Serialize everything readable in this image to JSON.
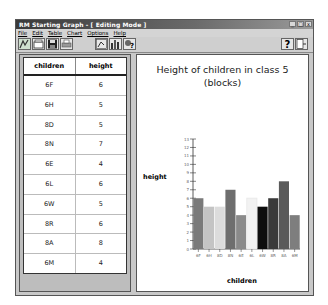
{
  "window": {
    "title": "RM Starting Graph - [ Editing Mode ]",
    "controls": [
      "_",
      "□",
      "x"
    ]
  },
  "menu": [
    "File",
    "Edit",
    "Table",
    "Chart",
    "Options",
    "Help"
  ],
  "toolbar": {
    "left_icons": [
      "new-graph-icon",
      "open-icon",
      "save-icon",
      "print-icon"
    ],
    "mid_icons": [
      "chart-type-icon",
      "bar-chart-icon",
      "wizard-help-icon"
    ],
    "right_icons": [
      "help-question-icon",
      "exit-door-icon"
    ],
    "help_glyph": "?"
  },
  "table": {
    "headers": [
      "children",
      "height"
    ],
    "rows": [
      [
        "6F",
        "6"
      ],
      [
        "6H",
        "5"
      ],
      [
        "8D",
        "5"
      ],
      [
        "8N",
        "7"
      ],
      [
        "6E",
        "4"
      ],
      [
        "6L",
        "6"
      ],
      [
        "6W",
        "5"
      ],
      [
        "8R",
        "6"
      ],
      [
        "8A",
        "8"
      ],
      [
        "6M",
        "4"
      ]
    ]
  },
  "chart_data": {
    "type": "bar",
    "title": "Height of children in class 5 (blocks)",
    "xlabel": "children",
    "ylabel": "height",
    "categories": [
      "6F",
      "6H",
      "8D",
      "8N",
      "6E",
      "6L",
      "6W",
      "8R",
      "8A",
      "6M"
    ],
    "values": [
      6,
      5,
      5,
      7,
      4,
      6,
      5,
      6,
      8,
      4
    ],
    "colors": [
      "#7a7a7a",
      "#c4c4c4",
      "#dcdcdc",
      "#6e6e6e",
      "#8a8a8a",
      "#f2f2f2",
      "#0e0e0e",
      "#3a3a3a",
      "#5a5a5a",
      "#7e7e7e"
    ],
    "ylim": [
      0,
      13
    ],
    "yticks": [
      0,
      1,
      2,
      3,
      4,
      5,
      6,
      7,
      8,
      9,
      10,
      11,
      12,
      13
    ],
    "grid": false,
    "legend": "none"
  }
}
